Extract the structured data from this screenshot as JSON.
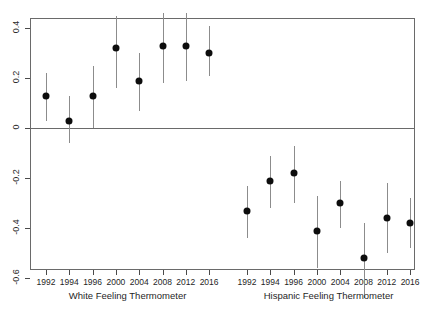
{
  "chart_data": {
    "type": "scatter",
    "title": "",
    "subtitle": "",
    "xlabel": "",
    "ylabel": "",
    "ylim": [
      -0.72,
      0.5
    ],
    "xlim": [
      0,
      16
    ],
    "grid": false,
    "legend": null,
    "zero_reference_line": 0,
    "y_ticks": [
      0.4,
      0.2,
      0,
      -0.2,
      -0.4,
      -0.6
    ],
    "y_tick_labels": [
      "0.4",
      "0.2",
      "0",
      "-0.2",
      "-0.4",
      "-0.6"
    ],
    "panels": [
      {
        "name": "white",
        "group_label": "White Feeling Thermometer",
        "categories": [
          "1992",
          "1994",
          "1996",
          "2000",
          "2004",
          "2008",
          "2012",
          "2016"
        ],
        "values": [
          0.13,
          0.03,
          0.13,
          0.32,
          0.19,
          0.33,
          0.33,
          0.3
        ],
        "ci_low": [
          0.03,
          -0.06,
          0.0,
          0.16,
          0.07,
          0.18,
          0.19,
          0.21
        ],
        "ci_high": [
          0.22,
          0.13,
          0.25,
          0.45,
          0.3,
          0.46,
          0.46,
          0.41
        ]
      },
      {
        "name": "hispanic",
        "group_label": "Hispanic Feeling Thermometer",
        "categories": [
          "1992",
          "1994",
          "1996",
          "2000",
          "2004",
          "2008",
          "2012",
          "2016"
        ],
        "values": [
          -0.33,
          -0.21,
          -0.18,
          -0.41,
          -0.3,
          -0.52,
          -0.36,
          -0.38
        ],
        "ci_low": [
          -0.44,
          -0.32,
          -0.3,
          -0.56,
          -0.4,
          -0.68,
          -0.5,
          -0.48
        ],
        "ci_high": [
          -0.23,
          -0.11,
          -0.07,
          -0.27,
          -0.21,
          -0.38,
          -0.22,
          -0.28
        ]
      }
    ]
  },
  "axis": {
    "y_label_text": "",
    "x_label_white": "White Feeling Thermometer",
    "x_label_hispanic": "Hispanic Feeling Thermometer"
  },
  "colors": {
    "point": "#0d0d0d",
    "whisker": "#8c8c8c",
    "frame": "#6a6a6a",
    "text": "#1f1f1f",
    "background": "#ffffff"
  }
}
